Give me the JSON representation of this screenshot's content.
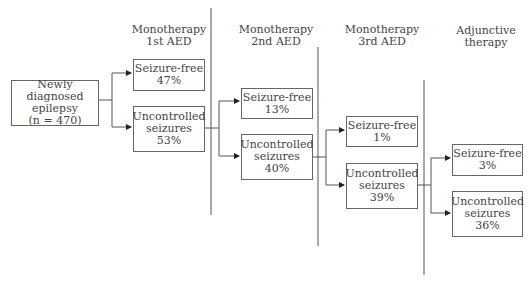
{
  "diagram": {
    "start": {
      "line1": "Newly diagnosed",
      "line2": "epilepsy",
      "line3": "(n = 470)"
    },
    "stages": [
      {
        "title_line1": "Monotherapy",
        "title_line2": "1st AED",
        "seizure_free": {
          "label": "Seizure-free",
          "value": "47%"
        },
        "uncontrolled": {
          "label_line1": "Uncontrolled",
          "label_line2": "seizures",
          "value": "53%"
        }
      },
      {
        "title_line1": "Monotherapy",
        "title_line2": "2nd AED",
        "seizure_free": {
          "label": "Seizure-free",
          "value": "13%"
        },
        "uncontrolled": {
          "label_line1": "Uncontrolled",
          "label_line2": "seizures",
          "value": "40%"
        }
      },
      {
        "title_line1": "Monotherapy",
        "title_line2": "3rd AED",
        "seizure_free": {
          "label": "Seizure-free",
          "value": "1%"
        },
        "uncontrolled": {
          "label_line1": "Uncontrolled",
          "label_line2": "seizures",
          "value": "39%"
        }
      },
      {
        "title_line1": "Adjunctive",
        "title_line2": "therapy",
        "seizure_free": {
          "label": "Seizure-free",
          "value": "3%"
        },
        "uncontrolled": {
          "label_line1": "Uncontrolled",
          "label_line2": "seizures",
          "value": "36%"
        }
      }
    ]
  }
}
